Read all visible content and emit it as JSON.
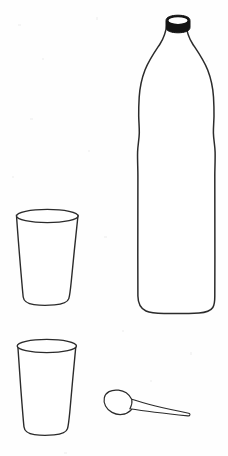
{
  "scene": {
    "title": "Line drawing of bottle, two drinking glasses and a spoon",
    "background_color": "#fefefe",
    "ink_color": "#2b2b2b",
    "cap_color": "#141414",
    "width": 228,
    "height": 456,
    "style": "black-and-white outline sketch, no shading, no text labels"
  },
  "objects": [
    {
      "id": "bottle",
      "label": "Plastic water bottle",
      "parts": [
        "cap",
        "neck",
        "shoulder",
        "body",
        "base"
      ],
      "bounds": {
        "x": 136,
        "y": 15,
        "width": 80,
        "height": 300
      }
    },
    {
      "id": "glass-upper",
      "label": "Drinking glass (upper)",
      "parts": [
        "rim",
        "wall",
        "base"
      ],
      "bounds": {
        "x": 14,
        "y": 209,
        "width": 68,
        "height": 97
      }
    },
    {
      "id": "glass-lower",
      "label": "Drinking glass (lower)",
      "parts": [
        "rim",
        "wall",
        "base"
      ],
      "bounds": {
        "x": 14,
        "y": 339,
        "width": 68,
        "height": 97
      }
    },
    {
      "id": "spoon",
      "label": "Spoon",
      "parts": [
        "bowl",
        "handle"
      ],
      "bounds": {
        "x": 104,
        "y": 390,
        "width": 86,
        "height": 28
      }
    }
  ],
  "object_count": 4,
  "labels": [],
  "annotations": []
}
